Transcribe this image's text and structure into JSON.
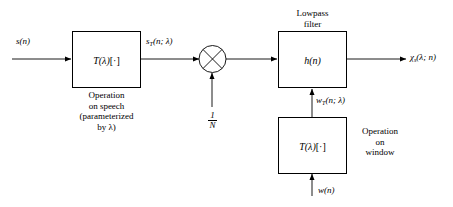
{
  "diagram": {
    "type": "block-diagram",
    "title_note": "Short-time analysis block diagram",
    "background_color": "#ffffff",
    "line_color": "#000000"
  },
  "signals": {
    "input_speech": "s(n)",
    "transformed_speech": "s",
    "transformed_speech_sub": "T",
    "transformed_speech_args": "(n; λ)",
    "gain": {
      "numerator": "1",
      "denominator": "N"
    },
    "transformed_window": "w",
    "transformed_window_sub": "T",
    "transformed_window_args": "(n; λ)",
    "input_window": "w(n)",
    "output": "χ",
    "output_sub": "s",
    "output_args": "(λ; n)"
  },
  "blocks": [
    {
      "id": "speech-operation",
      "inner_label": "T(λ)[·]",
      "caption_lines": [
        "Operation",
        "on speech",
        "(parameterized",
        "by λ)"
      ],
      "caption_position": "below"
    },
    {
      "id": "lowpass-filter",
      "inner_label": "h(n)",
      "caption_lines": [
        "Lowpass",
        "filter"
      ],
      "caption_position": "above"
    },
    {
      "id": "window-operation",
      "inner_label": "T(λ)[·]",
      "caption_lines": [
        "Operation",
        "on",
        "window"
      ],
      "caption_position": "right"
    }
  ],
  "multiplier": {
    "id": "multiplier-node",
    "symbol": "⊗",
    "description": "circle with cross (multiplier)"
  },
  "captions": {
    "speech_op_line1": "Operation",
    "speech_op_line2": "on speech",
    "speech_op_line3": "(parameterized",
    "speech_op_line4": "by λ)",
    "lowpass_line1": "Lowpass",
    "lowpass_line2": "filter",
    "window_op_line1": "Operation",
    "window_op_line2": "on",
    "window_op_line3": "window"
  },
  "block_labels": {
    "speech_operation_T": "T",
    "speech_operation_arg": "(λ)",
    "speech_operation_bracket": "[·]",
    "filter_label": "h(n)",
    "window_operation_T": "T",
    "window_operation_arg": "(λ)",
    "window_operation_bracket": "[·]"
  }
}
